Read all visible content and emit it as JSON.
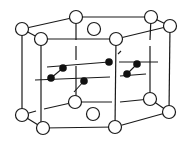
{
  "diagram": {
    "type": "crystal-structure",
    "colors": {
      "line": "#1a1a1a",
      "open_atom_fill": "#ffffff",
      "filled_atom": "#111111",
      "background": "#ffffff"
    },
    "open_atoms": [
      {
        "id": "A",
        "x": 22,
        "y": 29
      },
      {
        "id": "B",
        "x": 41,
        "y": 39
      },
      {
        "id": "C",
        "x": 76,
        "y": 17
      },
      {
        "id": "D",
        "x": 151,
        "y": 17
      },
      {
        "id": "E",
        "x": 170,
        "y": 26
      },
      {
        "id": "F",
        "x": 116,
        "y": 39
      },
      {
        "id": "G",
        "x": 94,
        "y": 29
      },
      {
        "id": "H",
        "x": 22,
        "y": 115
      },
      {
        "id": "I",
        "x": 43,
        "y": 128
      },
      {
        "id": "J",
        "x": 75,
        "y": 102
      },
      {
        "id": "K",
        "x": 150,
        "y": 99
      },
      {
        "id": "L",
        "x": 169,
        "y": 112
      },
      {
        "id": "M",
        "x": 115,
        "y": 127
      },
      {
        "id": "N",
        "x": 93,
        "y": 114
      }
    ],
    "filled_atoms": [
      {
        "x": 63,
        "y": 68
      },
      {
        "x": 51,
        "y": 78
      },
      {
        "x": 109,
        "y": 62
      },
      {
        "x": 84,
        "y": 81
      },
      {
        "x": 137,
        "y": 64
      },
      {
        "x": 127,
        "y": 74
      }
    ]
  }
}
